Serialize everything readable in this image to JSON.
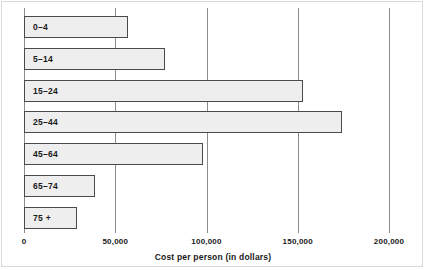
{
  "chart_data": {
    "type": "bar",
    "orientation": "horizontal",
    "title": "",
    "xlabel": "Cost per person (in dollars)",
    "ylabel": "",
    "categories": [
      "0–4",
      "5–14",
      "15–24",
      "25–44",
      "45–64",
      "65–74",
      "75 +"
    ],
    "values": [
      57000,
      77000,
      153000,
      174000,
      98000,
      39000,
      29000
    ],
    "xlim": [
      0,
      200000
    ],
    "xticks": [
      0,
      50000,
      100000,
      150000,
      200000
    ],
    "xtick_labels": [
      "0",
      "50,000",
      "100,000",
      "150,000",
      "200,000"
    ],
    "grid": "vertical",
    "legend": "none",
    "bar_fill_color": "#eeeeee",
    "bar_border_color": "#4a4a4a",
    "gridline_color": "#8a8a8a"
  },
  "axis": {
    "title": "Cost per person (in dollars)"
  }
}
